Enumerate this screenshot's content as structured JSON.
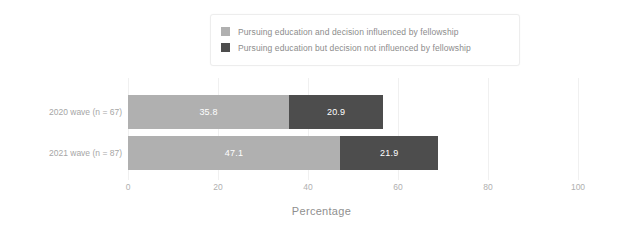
{
  "chart_data": {
    "type": "bar",
    "orientation": "horizontal",
    "stacked": true,
    "title": "",
    "xlabel": "Percentage",
    "ylabel": "",
    "xlim": [
      0,
      100
    ],
    "xticks": [
      "0",
      "20",
      "40",
      "60",
      "80",
      "100"
    ],
    "xtick_values": [
      0,
      20,
      40,
      60,
      80,
      100
    ],
    "grid": "vertical",
    "legend_position": "top-center",
    "categories": [
      "2020 wave (n = 67)",
      "2021 wave (n = 87)"
    ],
    "series": [
      {
        "name": "Pursuing education and decision influenced by fellowship",
        "color": "#b0b0b0",
        "values": [
          35.8,
          47.1
        ],
        "labels": [
          "35.8",
          "47.1"
        ]
      },
      {
        "name": "Pursuing education but decision not influenced by fellowship",
        "color": "#4d4d4d",
        "values": [
          20.9,
          21.9
        ],
        "labels": [
          "20.9",
          "21.9"
        ]
      }
    ]
  },
  "legend": {
    "items": [
      {
        "label": "Pursuing education and decision influenced by fellowship",
        "color": "#b0b0b0"
      },
      {
        "label": "Pursuing education but decision not influenced by fellowship",
        "color": "#4d4d4d"
      }
    ]
  },
  "axis": {
    "x_title": "Percentage"
  }
}
